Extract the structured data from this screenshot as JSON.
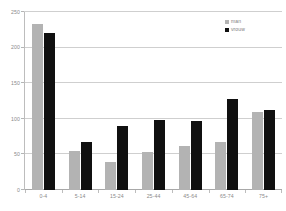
{
  "chart_data": {
    "type": "bar",
    "title": "",
    "subtitle": "",
    "xlabel": "",
    "ylabel": "",
    "categories": [
      "0-4",
      "5-14",
      "15-24",
      "25-44",
      "45-64",
      "65-74",
      "75+"
    ],
    "series": [
      {
        "name": "man",
        "color": "#b3b3b3",
        "values": [
          233,
          55,
          40,
          54,
          62,
          68,
          110
        ]
      },
      {
        "name": "vrouw",
        "color": "#101010",
        "values": [
          220,
          67,
          90,
          99,
          97,
          128,
          113
        ]
      }
    ],
    "ylim": [
      0,
      250
    ],
    "yticks": [
      0,
      50,
      100,
      150,
      200,
      250
    ],
    "ytick_labels": [
      "0",
      "50",
      "100",
      "150",
      "200",
      "250"
    ],
    "grid": true,
    "legend_position": "top-right"
  },
  "legend": {
    "entries": [
      {
        "label": "man"
      },
      {
        "label": "vrouw"
      }
    ]
  },
  "colors": {
    "series_man": "#b3b3b3",
    "series_vrouw": "#101010",
    "gridline": "#cfcfcf",
    "axis": "#bdbdbd",
    "tick_text": "#8a8a8a",
    "background": "#ffffff"
  }
}
